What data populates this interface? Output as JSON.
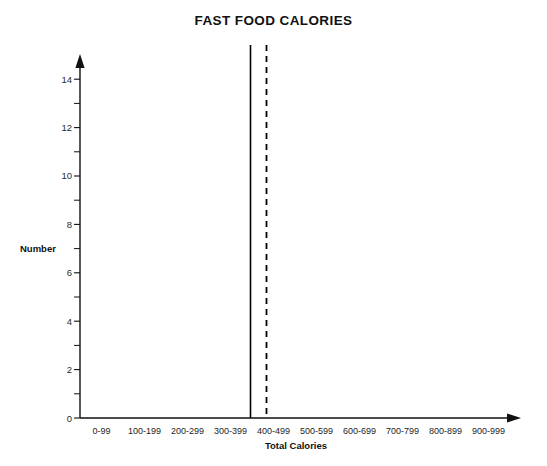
{
  "chart_data": {
    "type": "bar",
    "title": "FAST FOOD CALORIES",
    "xlabel": "Total Calories",
    "ylabel": "Number",
    "categories": [
      "0-99",
      "100-199",
      "200-299",
      "300-399",
      "400-499",
      "500-599",
      "600-699",
      "700-799",
      "800-899",
      "900-999"
    ],
    "values": [
      0,
      1,
      2,
      13,
      5,
      6,
      2,
      0,
      0,
      1
    ],
    "ylim": [
      0,
      15
    ],
    "ytick_labels": [
      "0",
      "2",
      "4",
      "6",
      "8",
      "10",
      "12",
      "14"
    ],
    "ytick_values": [
      0,
      2,
      4,
      6,
      8,
      10,
      12,
      14
    ],
    "yminor_tick_values": [
      1,
      3,
      5,
      7,
      9,
      11,
      13
    ],
    "grid": false,
    "legend": "none",
    "annotations": [
      {
        "name": "mean-line",
        "style": "solid",
        "x_value": 380
      },
      {
        "name": "median-line",
        "style": "dashed",
        "x_value": 418
      }
    ],
    "bar_color": "#808080",
    "bar_edge_color": "#3a3a3a",
    "axis_color": "#111111"
  }
}
